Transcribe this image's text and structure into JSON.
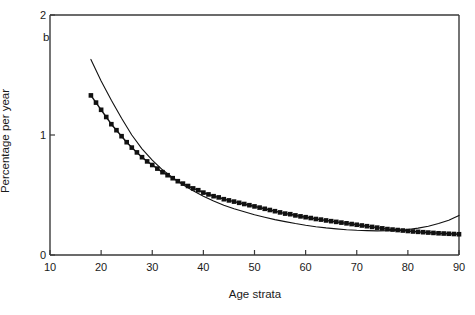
{
  "panel": {
    "label": "b"
  },
  "chart_data": {
    "type": "line",
    "title": "",
    "xlabel": "Age strata",
    "ylabel": "Percentage per year",
    "xlim": [
      10,
      90
    ],
    "ylim": [
      0,
      2
    ],
    "xticks": [
      10,
      20,
      30,
      40,
      50,
      60,
      70,
      80,
      90
    ],
    "xticklabels": [
      "10",
      "20",
      "30",
      "40",
      "50",
      "60",
      "70",
      "80",
      "90"
    ],
    "yticks": [
      0,
      1,
      2
    ],
    "yticklabels": [
      "0",
      "1",
      "2"
    ],
    "grid": false,
    "legend": null,
    "series": [
      {
        "name": "observed",
        "marker": "square",
        "line": "solid",
        "x": [
          18,
          19,
          20,
          21,
          22,
          23,
          24,
          25,
          26,
          27,
          28,
          29,
          30,
          31,
          32,
          33,
          34,
          35,
          36,
          37,
          38,
          39,
          40,
          41,
          42,
          43,
          44,
          45,
          46,
          47,
          48,
          49,
          50,
          51,
          52,
          53,
          54,
          55,
          56,
          57,
          58,
          59,
          60,
          61,
          62,
          63,
          64,
          65,
          66,
          67,
          68,
          69,
          70,
          71,
          72,
          73,
          74,
          75,
          76,
          77,
          78,
          79,
          80,
          81,
          82,
          83,
          84,
          85,
          86,
          87,
          88,
          89,
          90
        ],
        "y": [
          1.33,
          1.27,
          1.21,
          1.15,
          1.09,
          1.04,
          0.99,
          0.94,
          0.895,
          0.855,
          0.815,
          0.78,
          0.75,
          0.72,
          0.69,
          0.665,
          0.64,
          0.615,
          0.595,
          0.575,
          0.555,
          0.54,
          0.52,
          0.505,
          0.49,
          0.48,
          0.465,
          0.455,
          0.445,
          0.435,
          0.425,
          0.415,
          0.405,
          0.395,
          0.385,
          0.375,
          0.365,
          0.355,
          0.345,
          0.34,
          0.33,
          0.322,
          0.315,
          0.308,
          0.3,
          0.295,
          0.288,
          0.282,
          0.276,
          0.27,
          0.264,
          0.258,
          0.252,
          0.246,
          0.24,
          0.234,
          0.228,
          0.222,
          0.216,
          0.212,
          0.208,
          0.204,
          0.2,
          0.196,
          0.193,
          0.19,
          0.187,
          0.184,
          0.181,
          0.179,
          0.177,
          0.175,
          0.173
        ]
      },
      {
        "name": "fitted",
        "marker": "none",
        "line": "solid",
        "x": [
          18,
          20,
          22,
          24,
          26,
          28,
          30,
          32,
          34,
          36,
          38,
          40,
          42,
          44,
          46,
          48,
          50,
          52,
          54,
          56,
          58,
          60,
          62,
          64,
          66,
          68,
          70,
          72,
          74,
          76,
          78,
          80,
          82,
          84,
          86,
          88,
          90
        ],
        "y": [
          1.63,
          1.45,
          1.29,
          1.14,
          1.0,
          0.885,
          0.79,
          0.71,
          0.645,
          0.585,
          0.535,
          0.49,
          0.45,
          0.415,
          0.385,
          0.36,
          0.335,
          0.315,
          0.295,
          0.278,
          0.262,
          0.248,
          0.236,
          0.226,
          0.218,
          0.211,
          0.206,
          0.203,
          0.201,
          0.202,
          0.206,
          0.213,
          0.224,
          0.24,
          0.262,
          0.29,
          0.33
        ]
      }
    ]
  }
}
